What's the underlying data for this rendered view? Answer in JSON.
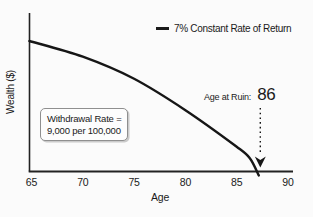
{
  "chart_data": {
    "type": "line",
    "title": "",
    "xlabel": "Age",
    "ylabel": "Wealth ($)",
    "x_ticks": [
      65,
      70,
      75,
      80,
      85,
      90
    ],
    "xlim": [
      65,
      90
    ],
    "y_ticks": [],
    "grid": false,
    "legend": {
      "position": "top-right",
      "label": "7% Constant Rate of Return"
    },
    "series": [
      {
        "name": "7% Constant Rate of Return",
        "note": "wealth_frac is wealth relative to starting wealth at age 65 (y axis unlabeled)",
        "points": [
          {
            "age": 64.8,
            "wealth_frac": 1.0
          },
          {
            "age": 70,
            "wealth_frac": 0.88
          },
          {
            "age": 75,
            "wealth_frac": 0.71
          },
          {
            "age": 80,
            "wealth_frac": 0.47
          },
          {
            "age": 85,
            "wealth_frac": 0.19
          },
          {
            "age": 86.3,
            "wealth_frac": 0.1
          },
          {
            "age": 87.15,
            "wealth_frac": -0.03
          }
        ]
      }
    ],
    "annotations": {
      "age_at_ruin": {
        "label": "Age at Ruin:",
        "value": "86",
        "arrow_age": 87.3,
        "arrow_style": "dotted-vertical-down"
      },
      "withdrawal_note": {
        "line1": "Withdrawal Rate =",
        "line2": "9,000 per 100,000"
      }
    },
    "colors": {
      "ink": "#1a1a1a",
      "axis": "#222222",
      "background": "#fbfbfb",
      "callout_border": "#8f8f8f"
    }
  }
}
